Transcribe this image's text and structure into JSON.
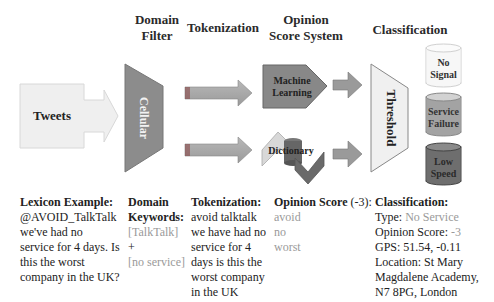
{
  "headers": {
    "domain_filter_line1": "Domain",
    "domain_filter_line2": "Filter",
    "tokenization": "Tokenization",
    "opinion_line1": "Opinion",
    "opinion_line2": "Score System",
    "classification": "Classification"
  },
  "nodes": {
    "tweets": "Tweets",
    "cellular": "Cellular",
    "machine_learning_line1": "Machine",
    "machine_learning_line2": "Learning",
    "dictionary": "Dictionary",
    "threshold": "Threshold",
    "no_signal_line1": "No",
    "no_signal_line2": "Signal",
    "service_failure_line1": "Service",
    "service_failure_line2": "Failure",
    "low_speed_line1": "Low",
    "low_speed_line2": "Speed"
  },
  "captions": {
    "lexicon": {
      "title": "Lexicon Example:",
      "lines": [
        "@AVOID_TalkTalk",
        "we've had no",
        "service for 4 days. Is",
        "this the worst",
        "company in the UK?"
      ]
    },
    "domain": {
      "title_line1": "Domain",
      "title_line2": "Keywords:",
      "kw1": "[TalkTalk]",
      "plus": " +",
      "kw2": "[no service]"
    },
    "tokenization": {
      "title": "Tokenization:",
      "lines": [
        "avoid talktalk",
        "we have had no",
        "service for 4",
        "days is this the",
        "worst company",
        "in the UK"
      ]
    },
    "opinion": {
      "title": "Opinion Score",
      "score": " (-3):",
      "words": [
        "avoid",
        "no",
        "worst"
      ]
    },
    "classification": {
      "title": "Classification:",
      "type_label": "Type: ",
      "type_value": "No Service",
      "score_label": "Opinion Score: ",
      "score_value": "-3",
      "gps": "GPS: 51.54, -0.11",
      "location_lines": [
        "Location: St Mary",
        "Magdalene Academy,",
        "N7 8PG, London"
      ]
    }
  },
  "colors": {
    "light_box": "#efefef",
    "dark_gray": "#8a8a8a",
    "mid_gray": "#a5a5a5",
    "darkest": "#6f6f6f",
    "caption_gray": "#9a9a9a"
  }
}
